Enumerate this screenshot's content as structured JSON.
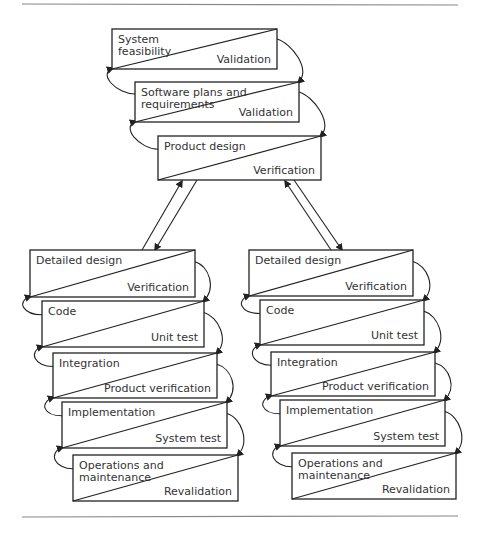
{
  "diagram": {
    "colors": {
      "stroke": "#222222",
      "text": "#333333",
      "rule": "#888888"
    },
    "top_chain": [
      {
        "id": "system-feasibility",
        "phase": [
          "System",
          "feasibility"
        ],
        "check": "Validation",
        "x": 112,
        "y": 29,
        "w": 165,
        "h": 40
      },
      {
        "id": "software-plans",
        "phase": [
          "Software plans and",
          "requirements"
        ],
        "check": "Validation",
        "x": 135,
        "y": 82,
        "w": 164,
        "h": 40
      },
      {
        "id": "product-design",
        "phase": [
          "Product design"
        ],
        "check": "Verification",
        "x": 158,
        "y": 136,
        "w": 163,
        "h": 44
      }
    ],
    "left_chain": [
      {
        "id": "left-detailed-design",
        "phase": [
          "Detailed design"
        ],
        "check": "Verification",
        "x": 30,
        "y": 250,
        "w": 165,
        "h": 47
      },
      {
        "id": "left-code",
        "phase": [
          "Code"
        ],
        "check": "Unit test",
        "x": 42,
        "y": 301,
        "w": 162,
        "h": 46
      },
      {
        "id": "left-integration",
        "phase": [
          "Integration"
        ],
        "check": "Product verification",
        "x": 53,
        "y": 353,
        "w": 164,
        "h": 45
      },
      {
        "id": "left-implementation",
        "phase": [
          "Implementation"
        ],
        "check": "System test",
        "x": 62,
        "y": 402,
        "w": 165,
        "h": 46
      },
      {
        "id": "left-operations",
        "phase": [
          "Operations and",
          "maintenance"
        ],
        "check": "Revalidation",
        "x": 73,
        "y": 455,
        "w": 165,
        "h": 46
      }
    ],
    "right_chain": [
      {
        "id": "right-detailed-design",
        "phase": [
          "Detailed design"
        ],
        "check": "Verification",
        "x": 249,
        "y": 250,
        "w": 164,
        "h": 46
      },
      {
        "id": "right-code",
        "phase": [
          "Code"
        ],
        "check": "Unit test",
        "x": 260,
        "y": 300,
        "w": 164,
        "h": 45
      },
      {
        "id": "right-integration",
        "phase": [
          "Integration"
        ],
        "check": "Product verification",
        "x": 271,
        "y": 352,
        "w": 164,
        "h": 44
      },
      {
        "id": "right-implementation",
        "phase": [
          "Implementation"
        ],
        "check": "System test",
        "x": 280,
        "y": 400,
        "w": 165,
        "h": 46
      },
      {
        "id": "right-operations",
        "phase": [
          "Operations and",
          "maintenance"
        ],
        "check": "Revalidation",
        "x": 292,
        "y": 453,
        "w": 164,
        "h": 46
      }
    ],
    "rules": {
      "top_y": 4,
      "bottom_y": 517,
      "x1": 22,
      "x2": 458
    }
  }
}
